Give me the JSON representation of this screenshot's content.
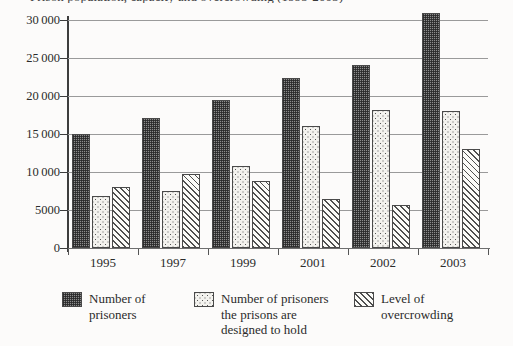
{
  "chart_data": {
    "type": "bar",
    "title": "Prison population, capacity and overcrowding (1995-2003)",
    "xlabel": "",
    "ylabel": "",
    "categories": [
      "1995",
      "1997",
      "1999",
      "2001",
      "2002",
      "2003"
    ],
    "series": [
      {
        "name": "Number of prisoners",
        "values": [
          15000,
          17100,
          19500,
          22400,
          24100,
          30900
        ]
      },
      {
        "name": "Number of prisoners the prisons are designed to hold",
        "values": [
          6900,
          7500,
          10800,
          16000,
          18200,
          18000
        ]
      },
      {
        "name": "Level of overcrowding",
        "values": [
          8000,
          9700,
          8800,
          6500,
          5700,
          13000
        ]
      }
    ],
    "ylim": [
      0,
      30000
    ],
    "ytick_values": [
      0,
      5000,
      10000,
      15000,
      20000,
      25000,
      30000
    ],
    "ytick_labels": [
      "0",
      "5000",
      "10000",
      "15000",
      "20000",
      "25000",
      "30000"
    ],
    "grid": true,
    "legend_position": "bottom"
  },
  "legend": {
    "items": [
      {
        "label": "Number of\nprisoners",
        "swatch": "dark-checker-swatch"
      },
      {
        "label": "Number of prisoners\nthe prisons are\ndesigned to hold",
        "swatch": "light-dotted-swatch"
      },
      {
        "label": "Level of\novercrowding",
        "swatch": "diagonal-hatch-swatch"
      }
    ]
  }
}
